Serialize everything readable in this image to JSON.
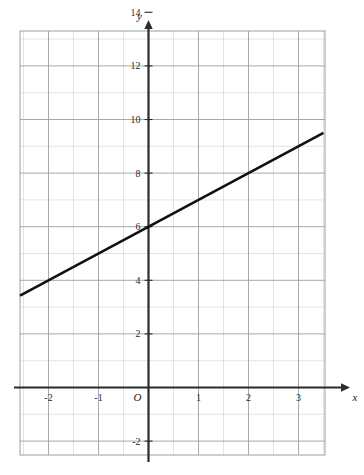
{
  "chart_data": {
    "type": "line",
    "title": "",
    "xlabel": "x",
    "ylabel": "y",
    "xlim": [
      -3.0,
      3.8
    ],
    "ylim": [
      -3.0,
      14.8
    ],
    "grid": true,
    "legend": null,
    "x_tick_labels": [
      "-2",
      "-1",
      "1",
      "2",
      "3"
    ],
    "x_tick_values": [
      -2,
      -1,
      1,
      2,
      3
    ],
    "y_tick_labels": [
      "14",
      "12",
      "10",
      "8",
      "6",
      "4",
      "2",
      "-2"
    ],
    "y_tick_values": [
      14,
      12,
      10,
      8,
      6,
      4,
      2,
      -2
    ],
    "origin_label": "O",
    "x_minor_step": 0.5,
    "y_minor_step": 1,
    "x_major_step": 1,
    "y_major_step": 2,
    "series": [
      {
        "name": "line",
        "x": [
          -2.6,
          3.5
        ],
        "y": [
          3.4,
          9.5
        ],
        "slope": 1,
        "intercept": 6,
        "color": "#111111",
        "width": 2.6
      }
    ],
    "colors": {
      "axis": "#2b2b2b",
      "grid_major": "#9aa0a6",
      "grid_minor": "#d4d8dc",
      "line": "#111111",
      "background": "#ffffff"
    }
  },
  "axes": {
    "x_axis_name": "x",
    "y_axis_name": "y"
  }
}
